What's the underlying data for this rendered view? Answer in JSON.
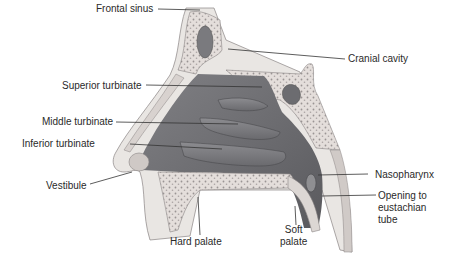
{
  "colors": {
    "airway": "#6f6f72",
    "airway_dark": "#505053",
    "turbinate": "#7e7e82",
    "bone": "#e4dedb",
    "bone_stipple": "#9a9494",
    "soft_tissue": "#e9e6e3",
    "outline": "#8a8484",
    "leader": "#333333",
    "label": "#2a2a2a"
  },
  "labels": {
    "frontal_sinus": "Frontal sinus",
    "cranial_cavity": "Cranial cavity",
    "superior_turbinate": "Superior turbinate",
    "middle_turbinate": "Middle turbinate",
    "inferior_turbinate": "Inferior turbinate",
    "vestibule": "Vestibule",
    "nasopharynx": "Nasopharynx",
    "eustachian_opening": "Opening to\neustachian\ntube",
    "hard_palate": "Hard palate",
    "soft_palate": "Soft\npalate"
  }
}
